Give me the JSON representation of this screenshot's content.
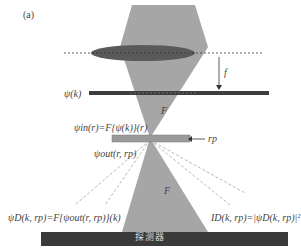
{
  "panel_label": "(a)",
  "labels": {
    "focal_length": "f",
    "psi_k": "ψ(k)",
    "cone_upper": "F",
    "cone_lower": "F",
    "psi_in": "ψin(r)=F{ψ(k)}(r)",
    "r_p": "rp",
    "psi_out": "ψout(r, rp)",
    "psi_D": "ψD(k, rp)=F{ψout(r, rp)}(k)",
    "I_D": "ID(k, rp)=|ψD(k, rp)|²",
    "detector": "探测器"
  },
  "colors": {
    "cone": "#a6a6a6",
    "lens": "#5a5a5a",
    "bars": "#3d3d3d",
    "detector": "#3a3a3a",
    "sample": "#9a9a9a"
  }
}
